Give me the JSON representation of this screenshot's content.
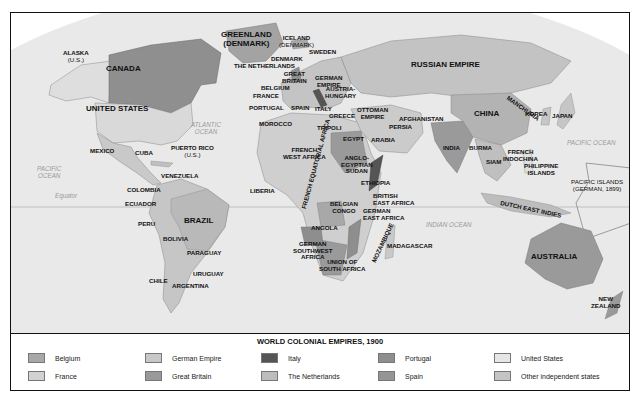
{
  "legend": {
    "title": "WORLD COLONIAL EMPIRES, 1900",
    "items": [
      {
        "label": "Belgium",
        "color": "#a8a8a8"
      },
      {
        "label": "France",
        "color": "#d2d2d2"
      },
      {
        "label": "German Empire",
        "color": "#c8c8c8"
      },
      {
        "label": "Great Britain",
        "color": "#9a9a9a"
      },
      {
        "label": "Italy",
        "color": "#555555"
      },
      {
        "label": "The Netherlands",
        "color": "#bdbdbd"
      },
      {
        "label": "Portugal",
        "color": "#8e8e8e"
      },
      {
        "label": "Spain",
        "color": "#949494"
      },
      {
        "label": "United States",
        "color": "#e6e6e6"
      },
      {
        "label": "Other independent states",
        "color": "#c4c4c4"
      }
    ]
  },
  "oceans": {
    "pacific_west": "PACIFIC\nOCEAN",
    "atlantic": "ATLANTIC\nOCEAN",
    "pacific_east": "PACIFIC OCEAN",
    "indian": "INDIAN OCEAN",
    "equator": "Equator"
  },
  "labels": {
    "alaska": "ALASKA",
    "alaska_sub": "(U.S.)",
    "canada": "CANADA",
    "united_states": "UNITED STATES",
    "mexico": "MEXICO",
    "cuba": "CUBA",
    "puerto_rico": "PUERTO RICO",
    "puerto_rico_sub": "(U.S.)",
    "venezuela": "VENEZUELA",
    "colombia": "COLOMBIA",
    "ecuador": "ECUADOR",
    "peru": "PERU",
    "brazil": "BRAZIL",
    "bolivia": "BOLIVIA",
    "paraguay": "PARAGUAY",
    "uruguay": "URUGUAY",
    "chile": "CHILE",
    "argentina": "ARGENTINA",
    "greenland": "GREENLAND",
    "greenland_sub": "(DENMARK)",
    "iceland": "ICELAND",
    "iceland_sub": "(DENMARK)",
    "sweden": "SWEDEN",
    "denmark": "DENMARK",
    "netherlands": "THE NETHERLANDS",
    "great_britain": "GREAT\nBRITAIN",
    "belgium": "BELGIUM",
    "france": "FRANCE",
    "portugal": "PORTUGAL",
    "spain": "SPAIN",
    "german_empire": "GERMAN\nEMPIRE",
    "austria_hungary": "AUSTRIA-\nHUNGARY",
    "italy": "ITALY",
    "greece": "GREECE",
    "ottoman_empire": "OTTOMAN\nEMPIRE",
    "russian_empire": "RUSSIAN EMPIRE",
    "morocco": "MOROCCO",
    "tripoli": "TRIPOLI",
    "egypt": "EGYPT",
    "arabia": "ARABIA",
    "persia": "PERSIA",
    "afghanistan": "AFGHANISTAN",
    "french_west_africa": "FRENCH\nWEST AFRICA",
    "anglo_egyptian_sudan": "ANGLO-\nEGYPTIAN\nSUDAN",
    "french_equatorial_africa": "FRENCH EQUATORIAL AFRICA",
    "ethiopia": "ETHIOPIA",
    "liberia": "LIBERIA",
    "british_east_africa": "BRITISH\nEAST AFRICA",
    "belgian_congo": "BELGIAN\nCONGO",
    "german_east_africa": "GERMAN\nEAST AFRICA",
    "angola": "ANGOLA",
    "german_southwest_africa": "GERMAN\nSOUTHWEST\nAFRICA",
    "mozambique": "MOZAMBIQUE",
    "union_of_south_africa": "UNION OF\nSOUTH AFRICA",
    "madagascar": "MADAGASCAR",
    "india": "INDIA",
    "burma": "BURMA",
    "siam": "SIAM",
    "china": "CHINA",
    "manchuria": "MANCHURIA",
    "korea": "KOREA",
    "japan": "JAPAN",
    "french_indochina": "FRENCH\nINDOCHINA",
    "philippine_islands": "PHILIPPINE\nISLANDS",
    "pacific_islands": "PACIFIC ISLANDS",
    "pacific_islands_sub": "(GERMAN, 1899)",
    "dutch_east_indies": "DUTCH EAST INDIES",
    "australia": "AUSTRALIA",
    "new_zealand": "NEW\nZEALAND"
  }
}
